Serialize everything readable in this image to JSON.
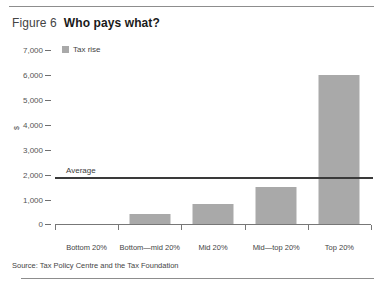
{
  "figure": {
    "number_label": "Figure 6",
    "title": "Who pays what?"
  },
  "legend": {
    "series_label": "Tax rise",
    "swatch_color": "#a9a9a9"
  },
  "axis": {
    "y_title": "$",
    "y_ticks": [
      "7,000",
      "6,000",
      "5,000",
      "4,000",
      "3,000",
      "2,000",
      "1,000",
      "0"
    ]
  },
  "annotation": {
    "average_label": "Average"
  },
  "source": {
    "text": "Source: Tax Policy Centre and the Tax Foundation"
  },
  "chart_data": {
    "type": "bar",
    "title": "Who pays what?",
    "xlabel": "",
    "ylabel": "$",
    "ylim": [
      0,
      7000
    ],
    "ytick_values": [
      0,
      1000,
      2000,
      3000,
      4000,
      5000,
      6000,
      7000
    ],
    "grid": false,
    "legend_position": "top-left",
    "categories": [
      "Bottom 20%",
      "Bottom—mid 20%",
      "Mid 20%",
      "Mid—top 20%",
      "Top 20%"
    ],
    "series": [
      {
        "name": "Tax rise",
        "color": "#a9a9a9",
        "values": [
          0,
          400,
          800,
          1500,
          6000
        ]
      }
    ],
    "reference_lines": [
      {
        "label": "Average",
        "value": 1900,
        "orientation": "horizontal",
        "color": "#3a3a3a"
      }
    ]
  }
}
